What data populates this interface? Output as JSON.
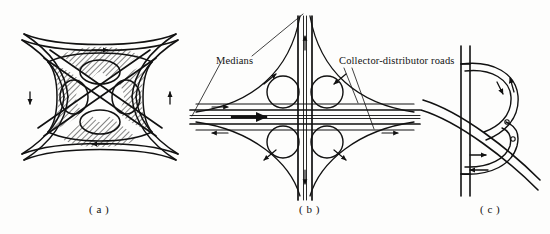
{
  "figure": {
    "kind": "engineering-line-drawing",
    "background_color": "#fdfdfc",
    "ink_color": "#111111"
  },
  "captions": {
    "a": "( a )",
    "b": "( b )",
    "c": "( c )"
  },
  "annotations": {
    "medians": "Medians",
    "collector_distributor": "Collector-distributor roads"
  },
  "panels": [
    {
      "id": "a",
      "caption": "( a )",
      "description": "Full cloverleaf interchange with hatched gore areas, four loop ramps and two crossing through-roads",
      "loop_count": 4,
      "has_hatching": true,
      "has_direction_arrows": true
    },
    {
      "id": "b",
      "caption": "( b )",
      "description": "Cloverleaf interchange with medians and collector-distributor roads on both highways",
      "loop_count": 4,
      "has_hatching": false,
      "has_direction_arrows": true,
      "labels": [
        "Medians",
        "Collector-distributor roads"
      ]
    },
    {
      "id": "c",
      "caption": "( c )",
      "description": "Partial cloverleaf (parclo) interchange with two loop ramps on one side",
      "loop_count": 2,
      "has_hatching": false,
      "has_direction_arrows": true
    }
  ]
}
